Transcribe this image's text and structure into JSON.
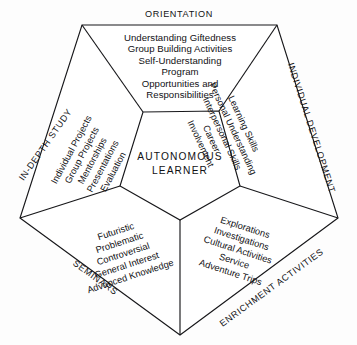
{
  "diagram": {
    "type": "pentagon-dimension-diagram",
    "center": {
      "line1": "AUTONOMOUS",
      "line2": "LEARNER"
    },
    "background_color": "#fdfdfd",
    "line_color": "#17171a",
    "sections": [
      {
        "id": "orientation",
        "label": "ORIENTATION",
        "position": "top",
        "items": [
          "Understanding Giftedness",
          "Group Building Activities",
          "Self-Understanding",
          "Program",
          "Opportunities and",
          "Responsibilities"
        ]
      },
      {
        "id": "individual-development",
        "label": "INDIVIDUAL DEVELOPMENT",
        "position": "right",
        "items": [
          "Learning Skills",
          "Personal Understanding",
          "Interpersonal Skills",
          "Career",
          "Involvement"
        ]
      },
      {
        "id": "enrichment-activities",
        "label": "ENRICHMENT ACTIVITIES",
        "position": "bottom-right",
        "items": [
          "Explorations",
          "Investigations",
          "Cultural Activities",
          "Service",
          "Adventure Trips"
        ]
      },
      {
        "id": "seminars",
        "label": "SEMINARS",
        "position": "bottom-left",
        "items": [
          "Futuristic",
          "Problematic",
          "Controversial",
          "General Interest",
          "Advanced Knowledge"
        ]
      },
      {
        "id": "in-depth-study",
        "label": "IN-DEPTH STUDY",
        "position": "left",
        "items": [
          "Individual Projects",
          "Group Projects",
          "Mentorships",
          "Presentations",
          "Evaluation"
        ]
      }
    ]
  }
}
